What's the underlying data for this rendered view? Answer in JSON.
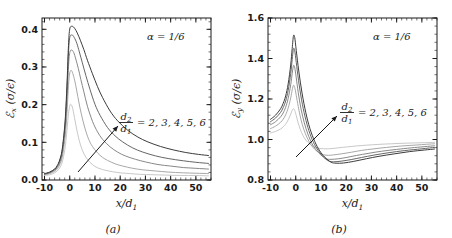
{
  "figure": {
    "panel_a_caption": "(a)",
    "panel_b_caption": "(b)"
  },
  "chart_data": [
    {
      "type": "line",
      "panel": "a",
      "title": "",
      "xlabel": "x/d₁",
      "ylabel": "ℰₓ (σ/ϵ)",
      "xlim": [
        -11,
        56
      ],
      "ylim": [
        0.0,
        0.43
      ],
      "xticks": [
        -10,
        0,
        10,
        20,
        30,
        40,
        50
      ],
      "xticklabels": [
        "-10",
        "0",
        "10",
        "20",
        "30",
        "40",
        "50"
      ],
      "yticks": [
        0.0,
        0.1,
        0.2,
        0.3,
        0.4
      ],
      "yticklabels": [
        "0.0",
        "0.1",
        "0.2",
        "0.3",
        "0.4"
      ],
      "grid": false,
      "legend": "none",
      "annotations": [
        {
          "name": "alpha-annotation",
          "text": "α = 1/6"
        },
        {
          "name": "ratio-annotation",
          "numerator": "d₂",
          "denominator": "d₁",
          "text": "= 2, 3, 4, 5, 6"
        }
      ],
      "series": [
        {
          "name": "d2/d1 = 2",
          "ratio": 2,
          "color": "#c8c8c8",
          "peak_x": 0.4,
          "peak_y": 0.201,
          "x": [
            -10,
            -8,
            -6,
            -5,
            -4,
            -3,
            -2,
            -1.5,
            -1,
            -0.5,
            0,
            0.4,
            1,
            1.6,
            2.2,
            3,
            4,
            5,
            6,
            7,
            8,
            10,
            12,
            14,
            17,
            20,
            24,
            28,
            33,
            38,
            44,
            50,
            55
          ],
          "y": [
            0.012,
            0.014,
            0.019,
            0.024,
            0.032,
            0.047,
            0.079,
            0.105,
            0.139,
            0.176,
            0.196,
            0.201,
            0.194,
            0.176,
            0.154,
            0.127,
            0.099,
            0.079,
            0.065,
            0.055,
            0.047,
            0.036,
            0.03,
            0.026,
            0.022,
            0.019,
            0.017,
            0.015,
            0.014,
            0.013,
            0.012,
            0.012,
            0.011
          ]
        },
        {
          "name": "d2/d1 = 3",
          "ratio": 3,
          "color": "#a8a8a8",
          "peak_x": 0.6,
          "peak_y": 0.291,
          "x": [
            -10,
            -8,
            -6,
            -5,
            -4,
            -3,
            -2,
            -1.5,
            -1,
            -0.5,
            0,
            0.6,
            1.2,
            2,
            2.8,
            3.6,
            4.6,
            6,
            7.5,
            9,
            11,
            13,
            15,
            18,
            21,
            25,
            29,
            34,
            39,
            45,
            50,
            55
          ],
          "y": [
            0.014,
            0.017,
            0.023,
            0.029,
            0.04,
            0.06,
            0.105,
            0.14,
            0.19,
            0.251,
            0.284,
            0.291,
            0.283,
            0.263,
            0.236,
            0.207,
            0.175,
            0.138,
            0.108,
            0.089,
            0.072,
            0.06,
            0.052,
            0.043,
            0.037,
            0.031,
            0.027,
            0.024,
            0.021,
            0.019,
            0.018,
            0.017
          ]
        },
        {
          "name": "d2/d1 = 4",
          "ratio": 4,
          "color": "#888888",
          "peak_x": 0.8,
          "peak_y": 0.345,
          "x": [
            -10,
            -8,
            -6,
            -5,
            -4,
            -3,
            -2,
            -1.5,
            -1,
            -0.5,
            0,
            0.8,
            1.6,
            2.4,
            3.4,
            4.4,
            5.6,
            7,
            9,
            11,
            13,
            16,
            19,
            22,
            26,
            30,
            35,
            40,
            45,
            50,
            55
          ],
          "y": [
            0.015,
            0.019,
            0.026,
            0.033,
            0.046,
            0.07,
            0.123,
            0.166,
            0.228,
            0.301,
            0.338,
            0.345,
            0.338,
            0.321,
            0.296,
            0.267,
            0.234,
            0.196,
            0.156,
            0.128,
            0.108,
            0.088,
            0.074,
            0.064,
            0.055,
            0.048,
            0.041,
            0.037,
            0.033,
            0.031,
            0.029
          ]
        },
        {
          "name": "d2/d1 = 5",
          "ratio": 5,
          "color": "#666666",
          "peak_x": 0.9,
          "peak_y": 0.385,
          "x": [
            -10,
            -8,
            -6,
            -5,
            -4,
            -3,
            -2,
            -1.5,
            -1,
            -0.5,
            0,
            0.9,
            1.8,
            2.8,
            3.8,
            5,
            6.4,
            8,
            10,
            12,
            15,
            18,
            21,
            25,
            29,
            34,
            39,
            45,
            50,
            55
          ],
          "y": [
            0.016,
            0.02,
            0.028,
            0.036,
            0.05,
            0.077,
            0.135,
            0.184,
            0.254,
            0.337,
            0.378,
            0.385,
            0.378,
            0.363,
            0.34,
            0.311,
            0.277,
            0.241,
            0.201,
            0.172,
            0.139,
            0.117,
            0.101,
            0.085,
            0.074,
            0.064,
            0.057,
            0.051,
            0.047,
            0.044
          ]
        },
        {
          "name": "d2/d1 = 6",
          "ratio": 6,
          "color": "#3c3c3c",
          "peak_x": 1.0,
          "peak_y": 0.408,
          "x": [
            -10,
            -8,
            -6,
            -5,
            -4,
            -3,
            -2,
            -1.5,
            -1,
            -0.5,
            0,
            1.0,
            2,
            3,
            4.2,
            5.6,
            7,
            9,
            11,
            13,
            16,
            19,
            23,
            27,
            31,
            36,
            41,
            46,
            51,
            55
          ],
          "y": [
            0.017,
            0.021,
            0.029,
            0.038,
            0.053,
            0.081,
            0.143,
            0.195,
            0.269,
            0.357,
            0.401,
            0.408,
            0.402,
            0.39,
            0.371,
            0.346,
            0.318,
            0.282,
            0.248,
            0.219,
            0.183,
            0.157,
            0.132,
            0.114,
            0.101,
            0.089,
            0.08,
            0.073,
            0.068,
            0.065
          ]
        }
      ]
    },
    {
      "type": "line",
      "panel": "b",
      "title": "",
      "xlabel": "x/d₁",
      "ylabel": "ℰᵧ (σ/ϵ)",
      "xlim": [
        -11,
        56
      ],
      "ylim": [
        0.8,
        1.6
      ],
      "xticks": [
        -10,
        0,
        10,
        20,
        30,
        40,
        50
      ],
      "xticklabels": [
        "-10",
        "0",
        "10",
        "20",
        "30",
        "40",
        "50"
      ],
      "yticks": [
        0.8,
        1.0,
        1.2,
        1.4,
        1.6
      ],
      "yticklabels": [
        "0.8",
        "1.0",
        "1.2",
        "1.4",
        "1.6"
      ],
      "grid": false,
      "legend": "none",
      "annotations": [
        {
          "name": "alpha-annotation",
          "text": "α = 1/6"
        },
        {
          "name": "ratio-annotation",
          "numerator": "d₂",
          "denominator": "d₁",
          "text": "= 2, 3, 4, 5, 6"
        }
      ],
      "series": [
        {
          "name": "d2/d1 = 2",
          "ratio": 2,
          "color": "#c8c8c8",
          "peak_x": -0.9,
          "peak_y": 1.152,
          "min_x": 10,
          "min_y": 0.955,
          "x": [
            -10,
            -8,
            -6,
            -5,
            -4,
            -3,
            -2,
            -1.4,
            -0.9,
            -0.4,
            0.2,
            0.9,
            1.8,
            2.8,
            4,
            5.5,
            7,
            8.5,
            10,
            12,
            14,
            17,
            20,
            24,
            28,
            33,
            38,
            44,
            50,
            55
          ],
          "y": [
            1.032,
            1.04,
            1.052,
            1.062,
            1.076,
            1.097,
            1.125,
            1.145,
            1.152,
            1.143,
            1.118,
            1.085,
            1.05,
            1.021,
            0.997,
            0.978,
            0.966,
            0.959,
            0.955,
            0.954,
            0.955,
            0.959,
            0.963,
            0.968,
            0.972,
            0.976,
            0.979,
            0.982,
            0.984,
            0.986
          ]
        },
        {
          "name": "d2/d1 = 3",
          "ratio": 3,
          "color": "#a8a8a8",
          "peak_x": -0.9,
          "peak_y": 1.268,
          "min_x": 11,
          "min_y": 0.925,
          "x": [
            -10,
            -8,
            -6,
            -5,
            -4,
            -3,
            -2,
            -1.4,
            -0.9,
            -0.4,
            0.2,
            1,
            2,
            3.2,
            4.5,
            6,
            7.5,
            9,
            11,
            13,
            15,
            18,
            22,
            26,
            31,
            36,
            42,
            48,
            55
          ],
          "y": [
            1.054,
            1.066,
            1.085,
            1.1,
            1.122,
            1.156,
            1.205,
            1.245,
            1.268,
            1.257,
            1.218,
            1.162,
            1.102,
            1.05,
            1.009,
            0.975,
            0.952,
            0.937,
            0.925,
            0.922,
            0.924,
            0.929,
            0.937,
            0.946,
            0.954,
            0.961,
            0.968,
            0.973,
            0.979
          ]
        },
        {
          "name": "d2/d1 = 4",
          "ratio": 4,
          "color": "#888888",
          "peak_x": -0.9,
          "peak_y": 1.365,
          "min_x": 12,
          "min_y": 0.905,
          "x": [
            -10,
            -8,
            -6,
            -5,
            -4,
            -3,
            -2,
            -1.4,
            -0.9,
            -0.4,
            0.2,
            1,
            2.1,
            3.4,
            4.8,
            6.4,
            8,
            10,
            12,
            14,
            17,
            20,
            24,
            29,
            34,
            40,
            46,
            55
          ],
          "y": [
            1.073,
            1.088,
            1.112,
            1.131,
            1.159,
            1.203,
            1.27,
            1.326,
            1.365,
            1.354,
            1.305,
            1.231,
            1.151,
            1.082,
            1.027,
            0.981,
            0.95,
            0.923,
            0.905,
            0.902,
            0.905,
            0.911,
            0.921,
            0.932,
            0.942,
            0.951,
            0.959,
            0.969
          ]
        },
        {
          "name": "d2/d1 = 5",
          "ratio": 5,
          "color": "#666666",
          "peak_x": -0.9,
          "peak_y": 1.448,
          "min_x": 13,
          "min_y": 0.894,
          "x": [
            -10,
            -8,
            -6,
            -5,
            -4,
            -3,
            -2,
            -1.4,
            -0.9,
            -0.4,
            0.2,
            1.1,
            2.3,
            3.7,
            5.2,
            7,
            9,
            11,
            13,
            15,
            18,
            22,
            26,
            31,
            37,
            43,
            50,
            55
          ],
          "y": [
            1.088,
            1.106,
            1.134,
            1.157,
            1.19,
            1.243,
            1.325,
            1.395,
            1.448,
            1.438,
            1.381,
            1.292,
            1.196,
            1.112,
            1.044,
            0.986,
            0.944,
            0.914,
            0.894,
            0.89,
            0.893,
            0.901,
            0.911,
            0.923,
            0.935,
            0.945,
            0.954,
            0.961
          ]
        },
        {
          "name": "d2/d1 = 6",
          "ratio": 6,
          "color": "#3c3c3c",
          "peak_x": -0.9,
          "peak_y": 1.512,
          "min_x": 14,
          "min_y": 0.888,
          "x": [
            -10,
            -8,
            -6,
            -5,
            -4,
            -3,
            -2,
            -1.4,
            -0.9,
            -0.4,
            0.2,
            1.2,
            2.5,
            4,
            5.6,
            7.5,
            9.5,
            11.5,
            14,
            16,
            19,
            23,
            28,
            33,
            39,
            45,
            51,
            55
          ],
          "y": [
            1.1,
            1.12,
            1.152,
            1.178,
            1.215,
            1.275,
            1.368,
            1.45,
            1.512,
            1.503,
            1.44,
            1.338,
            1.229,
            1.132,
            1.055,
            0.991,
            0.944,
            0.913,
            0.888,
            0.883,
            0.884,
            0.892,
            0.905,
            0.917,
            0.929,
            0.94,
            0.948,
            0.953
          ]
        }
      ]
    }
  ]
}
